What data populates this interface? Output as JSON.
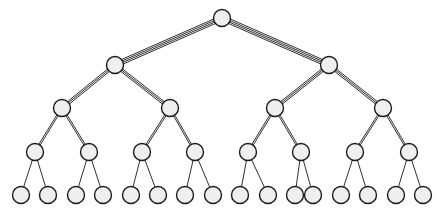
{
  "diagram": {
    "type": "tree",
    "width": 443,
    "height": 215,
    "background_color": "#ffffff",
    "node_fill_color": "#efefef",
    "node_stroke_color": "#1a1a1a",
    "edge_color": "#1a1a1a",
    "node_radius": 8.5,
    "leaf_radius": 8.5,
    "levels": 5,
    "branching_factor": 2,
    "node_count": 31,
    "leaf_count": 16,
    "edge_style_note": "edges drawn as multiple parallel hairlines, count decreasing with depth",
    "edge_line_counts": [
      4,
      3,
      2,
      1
    ],
    "edge_line_spacing": [
      1.6,
      1.5,
      1.5,
      0
    ],
    "nodes": [
      {
        "id": "n0",
        "level": 0,
        "x": 222,
        "y": 18,
        "r": 8.5
      },
      {
        "id": "n1",
        "level": 1,
        "x": 115,
        "y": 65,
        "r": 8.5
      },
      {
        "id": "n2",
        "level": 1,
        "x": 329,
        "y": 65,
        "r": 8.5
      },
      {
        "id": "n3",
        "level": 2,
        "x": 62,
        "y": 108,
        "r": 8.5
      },
      {
        "id": "n4",
        "level": 2,
        "x": 170,
        "y": 108,
        "r": 8.5
      },
      {
        "id": "n5",
        "level": 2,
        "x": 275,
        "y": 108,
        "r": 8.5
      },
      {
        "id": "n6",
        "level": 2,
        "x": 383,
        "y": 108,
        "r": 8.5
      },
      {
        "id": "n7",
        "level": 3,
        "x": 35,
        "y": 152,
        "r": 8.5
      },
      {
        "id": "n8",
        "level": 3,
        "x": 89,
        "y": 152,
        "r": 8.5
      },
      {
        "id": "n9",
        "level": 3,
        "x": 142,
        "y": 152,
        "r": 8.5
      },
      {
        "id": "n10",
        "level": 3,
        "x": 195,
        "y": 152,
        "r": 8.5
      },
      {
        "id": "n11",
        "level": 3,
        "x": 248,
        "y": 152,
        "r": 8.5
      },
      {
        "id": "n12",
        "level": 3,
        "x": 301,
        "y": 152,
        "r": 8.5
      },
      {
        "id": "n13",
        "level": 3,
        "x": 355,
        "y": 152,
        "r": 8.5
      },
      {
        "id": "n14",
        "level": 3,
        "x": 409,
        "y": 152,
        "r": 8.5
      },
      {
        "id": "n15",
        "level": 4,
        "x": 21,
        "y": 195,
        "r": 8.5
      },
      {
        "id": "n16",
        "level": 4,
        "x": 48,
        "y": 195,
        "r": 8.5
      },
      {
        "id": "n17",
        "level": 4,
        "x": 76,
        "y": 195,
        "r": 8.5
      },
      {
        "id": "n18",
        "level": 4,
        "x": 103,
        "y": 195,
        "r": 8.5
      },
      {
        "id": "n19",
        "level": 4,
        "x": 131,
        "y": 195,
        "r": 8.5
      },
      {
        "id": "n20",
        "level": 4,
        "x": 158,
        "y": 195,
        "r": 8.5
      },
      {
        "id": "n21",
        "level": 4,
        "x": 185,
        "y": 195,
        "r": 8.5
      },
      {
        "id": "n22",
        "level": 4,
        "x": 213,
        "y": 195,
        "r": 8.5
      },
      {
        "id": "n23",
        "level": 4,
        "x": 240,
        "y": 195,
        "r": 8.5
      },
      {
        "id": "n24",
        "level": 4,
        "x": 268,
        "y": 195,
        "r": 8.5
      },
      {
        "id": "n25",
        "level": 4,
        "x": 295,
        "y": 195,
        "r": 8.5
      },
      {
        "id": "n26",
        "level": 4,
        "x": 313,
        "y": 195,
        "r": 8.5
      },
      {
        "id": "n27",
        "level": 4,
        "x": 341,
        "y": 195,
        "r": 8.5
      },
      {
        "id": "n28",
        "level": 4,
        "x": 368,
        "y": 195,
        "r": 8.5
      },
      {
        "id": "n29",
        "level": 4,
        "x": 396,
        "y": 195,
        "r": 8.5
      },
      {
        "id": "n30",
        "level": 4,
        "x": 423,
        "y": 195,
        "r": 8.5
      }
    ],
    "edges": [
      {
        "from": "n0",
        "to": "n1",
        "level": 0
      },
      {
        "from": "n0",
        "to": "n2",
        "level": 0
      },
      {
        "from": "n1",
        "to": "n3",
        "level": 1
      },
      {
        "from": "n1",
        "to": "n4",
        "level": 1
      },
      {
        "from": "n2",
        "to": "n5",
        "level": 1
      },
      {
        "from": "n2",
        "to": "n6",
        "level": 1
      },
      {
        "from": "n3",
        "to": "n7",
        "level": 2
      },
      {
        "from": "n3",
        "to": "n8",
        "level": 2
      },
      {
        "from": "n4",
        "to": "n9",
        "level": 2
      },
      {
        "from": "n4",
        "to": "n10",
        "level": 2
      },
      {
        "from": "n5",
        "to": "n11",
        "level": 2
      },
      {
        "from": "n5",
        "to": "n12",
        "level": 2
      },
      {
        "from": "n6",
        "to": "n13",
        "level": 2
      },
      {
        "from": "n6",
        "to": "n14",
        "level": 2
      },
      {
        "from": "n7",
        "to": "n15",
        "level": 3
      },
      {
        "from": "n7",
        "to": "n16",
        "level": 3
      },
      {
        "from": "n8",
        "to": "n17",
        "level": 3
      },
      {
        "from": "n8",
        "to": "n18",
        "level": 3
      },
      {
        "from": "n9",
        "to": "n19",
        "level": 3
      },
      {
        "from": "n9",
        "to": "n20",
        "level": 3
      },
      {
        "from": "n10",
        "to": "n21",
        "level": 3
      },
      {
        "from": "n10",
        "to": "n22",
        "level": 3
      },
      {
        "from": "n11",
        "to": "n23",
        "level": 3
      },
      {
        "from": "n11",
        "to": "n24",
        "level": 3
      },
      {
        "from": "n12",
        "to": "n25",
        "level": 3
      },
      {
        "from": "n12",
        "to": "n26",
        "level": 3
      },
      {
        "from": "n13",
        "to": "n27",
        "level": 3
      },
      {
        "from": "n13",
        "to": "n28",
        "level": 3
      },
      {
        "from": "n14",
        "to": "n29",
        "level": 3
      },
      {
        "from": "n14",
        "to": "n30",
        "level": 3
      }
    ]
  }
}
